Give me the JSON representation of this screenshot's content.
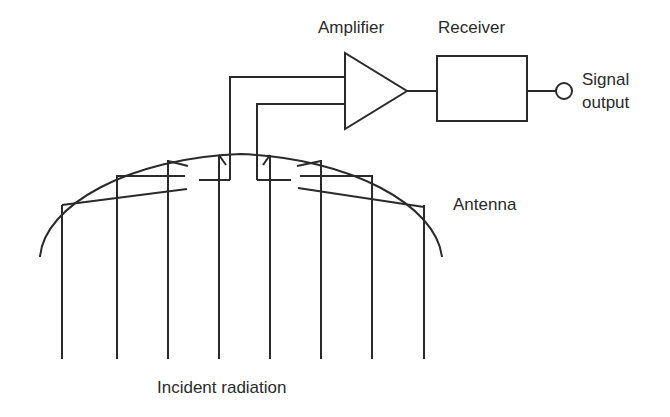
{
  "diagram": {
    "labels": {
      "amplifier": "Amplifier",
      "receiver": "Receiver",
      "signal_output_line1": "Signal",
      "signal_output_line2": "output",
      "antenna": "Antenna",
      "incident_radiation": "Incident radiation"
    },
    "components": [
      {
        "id": "antenna",
        "shape": "parabolic-arc"
      },
      {
        "id": "amplifier",
        "shape": "triangle"
      },
      {
        "id": "receiver",
        "shape": "rectangle"
      },
      {
        "id": "signal-output",
        "shape": "circle-terminal"
      }
    ],
    "incident_ray_count": 8,
    "colors": {
      "stroke": "#2a2a2a",
      "background": "#ffffff"
    }
  }
}
